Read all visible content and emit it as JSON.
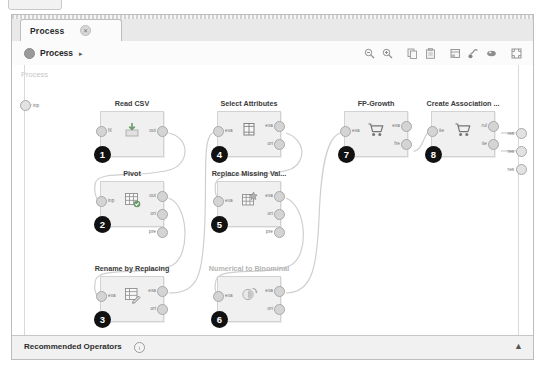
{
  "window": {
    "tab": {
      "label": "Process",
      "close_icon": "close-icon",
      "close_glyph": "✕"
    }
  },
  "breadcrumb": {
    "dot_icon": "process-dot-icon",
    "label": "Process",
    "arrow_glyph": "▸"
  },
  "toolbar": {
    "buttons": [
      {
        "name": "zoom-out-icon",
        "title": "Zoom Out"
      },
      {
        "name": "zoom-in-icon",
        "title": "Zoom In"
      },
      {
        "name": "copy-icon",
        "title": "Copy"
      },
      {
        "name": "paste-icon",
        "title": "Paste"
      },
      {
        "name": "auto-layout-icon",
        "title": "Auto Layout"
      },
      {
        "name": "auto-wire-icon",
        "title": "Auto Wire"
      },
      {
        "name": "pan-icon",
        "title": "Pan"
      },
      {
        "name": "fit-to-screen-icon",
        "title": "Fit to Screen"
      }
    ]
  },
  "canvas": {
    "watermark": "Process",
    "left_rail_port": {
      "label": "inp"
    },
    "right_rail_ports": [
      {
        "label": "res"
      },
      {
        "label": "res"
      },
      {
        "label": "res"
      }
    ],
    "nodes": [
      {
        "badge": "1",
        "title": "Read CSV",
        "title_muted": false,
        "icon": "read-csv-icon",
        "x": 88,
        "y": 46,
        "inputs": [
          {
            "label": "fil"
          }
        ],
        "outputs": [
          {
            "label": "out"
          }
        ]
      },
      {
        "badge": "2",
        "title": "Pivot",
        "title_muted": false,
        "icon": "pivot-table-icon",
        "x": 88,
        "y": 116,
        "inputs": [
          {
            "label": "inp"
          }
        ],
        "outputs": [
          {
            "label": "out"
          },
          {
            "label": "ori"
          },
          {
            "label": "pre"
          }
        ]
      },
      {
        "badge": "3",
        "title": "Rename by Replacing",
        "title_muted": false,
        "icon": "rename-table-icon",
        "x": 88,
        "y": 211,
        "inputs": [
          {
            "label": "exa"
          }
        ],
        "outputs": [
          {
            "label": "exa"
          },
          {
            "label": "ori"
          }
        ]
      },
      {
        "badge": "4",
        "title": "Select Attributes",
        "title_muted": false,
        "icon": "select-attributes-icon",
        "x": 205,
        "y": 46,
        "inputs": [
          {
            "label": "exa"
          }
        ],
        "outputs": [
          {
            "label": "exa"
          },
          {
            "label": "ori"
          }
        ]
      },
      {
        "badge": "5",
        "title": "Replace Missing Val...",
        "title_muted": false,
        "icon": "replace-missing-values-icon",
        "x": 205,
        "y": 116,
        "inputs": [
          {
            "label": "exa"
          }
        ],
        "outputs": [
          {
            "label": "exa"
          },
          {
            "label": "ori"
          },
          {
            "label": "pre"
          }
        ]
      },
      {
        "badge": "6",
        "title": "Numerical to Binominal",
        "title_muted": true,
        "icon": "numerical-to-binominal-icon",
        "x": 205,
        "y": 211,
        "inputs": [
          {
            "label": "exa"
          }
        ],
        "outputs": [
          {
            "label": "exa"
          },
          {
            "label": "ori"
          }
        ]
      },
      {
        "badge": "7",
        "title": "FP-Growth",
        "title_muted": false,
        "icon": "shopping-cart-icon",
        "x": 332,
        "y": 46,
        "inputs": [
          {
            "label": "exa"
          }
        ],
        "outputs": [
          {
            "label": "exa"
          },
          {
            "label": "fre"
          }
        ]
      },
      {
        "badge": "8",
        "title": "Create Association ...",
        "title_muted": false,
        "icon": "shopping-cart-icon",
        "x": 419,
        "y": 46,
        "inputs": [
          {
            "label": "ite"
          }
        ],
        "outputs": [
          {
            "label": "rul"
          },
          {
            "label": "ite"
          }
        ]
      }
    ]
  },
  "footer": {
    "title": "Recommended Operators",
    "info_glyph": "i",
    "collapse_glyph": "▲"
  }
}
